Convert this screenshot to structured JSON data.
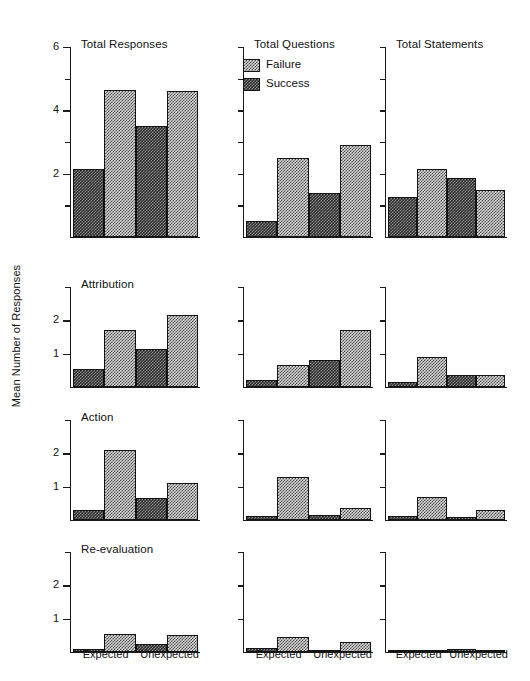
{
  "chart_data": {
    "type": "bar",
    "ylabel": "Mean Number of Responses",
    "xlabel": "",
    "grid": false,
    "legend": {
      "position": "top-center-panel",
      "entries": [
        {
          "name": "Failure",
          "swatch": "light-checker"
        },
        {
          "name": "Success",
          "swatch": "dark-checker"
        }
      ]
    },
    "categories": [
      "Expected",
      "Unexpected"
    ],
    "series_order": [
      "Success",
      "Failure"
    ],
    "bar_order": [
      "Expected-Success",
      "Expected-Failure",
      "Unexpected-Success",
      "Unexpected-Failure"
    ],
    "columns": [
      "Total Responses",
      "Total Questions",
      "Total Statements"
    ],
    "rows": [
      "Total Responses",
      "Attribution",
      "Action",
      "Re-evaluation"
    ],
    "panels": [
      {
        "row": 0,
        "col": 0,
        "title": "Total Responses",
        "ylim": [
          0,
          6
        ],
        "yticks": [
          0,
          1,
          2,
          3,
          4,
          5,
          6
        ],
        "yticklabels": [
          "",
          "",
          "2",
          "",
          "4",
          "",
          "6"
        ],
        "values": [
          2.15,
          4.65,
          3.5,
          4.6
        ]
      },
      {
        "row": 0,
        "col": 1,
        "title": "Total Questions",
        "ylim": [
          0,
          6
        ],
        "yticks": [
          0,
          1,
          2,
          3,
          4,
          5,
          6
        ],
        "yticklabels": [
          "",
          "",
          "",
          "",
          "",
          "",
          ""
        ],
        "values": [
          0.5,
          2.5,
          1.4,
          2.9
        ]
      },
      {
        "row": 0,
        "col": 2,
        "title": "Total Statements",
        "ylim": [
          0,
          6
        ],
        "yticks": [
          0,
          1,
          2,
          3,
          4,
          5,
          6
        ],
        "yticklabels": [
          "",
          "",
          "",
          "",
          "",
          "",
          ""
        ],
        "values": [
          1.25,
          2.15,
          1.85,
          1.5
        ]
      },
      {
        "row": 1,
        "col": 0,
        "title": "Attribution",
        "ylim": [
          0,
          3
        ],
        "yticks": [
          0,
          1,
          2,
          3
        ],
        "yticklabels": [
          "",
          "1",
          "2",
          ""
        ],
        "values": [
          0.55,
          1.7,
          1.15,
          2.15
        ]
      },
      {
        "row": 1,
        "col": 1,
        "title": "",
        "ylim": [
          0,
          3
        ],
        "yticks": [
          0,
          1,
          2,
          3
        ],
        "yticklabels": [
          "",
          "",
          "",
          ""
        ],
        "values": [
          0.2,
          0.65,
          0.8,
          1.7
        ]
      },
      {
        "row": 1,
        "col": 2,
        "title": "",
        "ylim": [
          0,
          3
        ],
        "yticks": [
          0,
          1,
          2,
          3
        ],
        "yticklabels": [
          "",
          "",
          "",
          ""
        ],
        "values": [
          0.15,
          0.9,
          0.35,
          0.35
        ]
      },
      {
        "row": 2,
        "col": 0,
        "title": "Action",
        "ylim": [
          0,
          3
        ],
        "yticks": [
          0,
          1,
          2,
          3
        ],
        "yticklabels": [
          "",
          "1",
          "2",
          ""
        ],
        "values": [
          0.3,
          2.1,
          0.65,
          1.1
        ]
      },
      {
        "row": 2,
        "col": 1,
        "title": "",
        "ylim": [
          0,
          3
        ],
        "yticks": [
          0,
          1,
          2,
          3
        ],
        "yticklabels": [
          "",
          "",
          "",
          ""
        ],
        "values": [
          0.12,
          1.3,
          0.15,
          0.35
        ]
      },
      {
        "row": 2,
        "col": 2,
        "title": "",
        "ylim": [
          0,
          3
        ],
        "yticks": [
          0,
          1,
          2,
          3
        ],
        "yticklabels": [
          "",
          "",
          "",
          ""
        ],
        "values": [
          0.12,
          0.7,
          0.1,
          0.3
        ]
      },
      {
        "row": 3,
        "col": 0,
        "title": "Re-evaluation",
        "ylim": [
          0,
          3
        ],
        "yticks": [
          0,
          1,
          2,
          3
        ],
        "yticklabels": [
          "",
          "1",
          "2",
          ""
        ],
        "values": [
          0.1,
          0.55,
          0.25,
          0.5
        ]
      },
      {
        "row": 3,
        "col": 1,
        "title": "",
        "ylim": [
          0,
          3
        ],
        "yticks": [
          0,
          1,
          2,
          3
        ],
        "yticklabels": [
          "",
          "",
          "",
          ""
        ],
        "values": [
          0.12,
          0.45,
          0.06,
          0.3
        ]
      },
      {
        "row": 3,
        "col": 2,
        "title": "",
        "ylim": [
          0,
          3
        ],
        "yticks": [
          0,
          1,
          2,
          3
        ],
        "yticklabels": [
          "",
          "",
          "",
          ""
        ],
        "values": [
          0.0,
          0.07,
          0.1,
          0.06
        ]
      }
    ],
    "xtick_labels_per_column": [
      [
        "Expected",
        "Unexpected"
      ],
      [
        "Expected",
        "Unexpected"
      ],
      [
        "Expected",
        "Unexpected"
      ]
    ],
    "colors": {
      "failure_fill": "#d9d9d9",
      "failure_pattern": "#4a4a4a",
      "success_fill": "#2b2b2b",
      "success_pattern": "#8e8e8e",
      "axis": "#1a1a1a",
      "text": "#111111",
      "background": "#ffffff"
    }
  },
  "axis_label": {
    "y": "Mean Number of Responses"
  },
  "legend_labels": {
    "failure": "Failure",
    "success": "Success"
  },
  "panel_titles": {
    "total_responses": "Total Responses",
    "total_questions": "Total Questions",
    "total_statements": "Total Statements",
    "attribution": "Attribution",
    "action": "Action",
    "reevaluation": "Re-evaluation"
  },
  "xtick": {
    "expected": "Expected",
    "unexpected": "Unexpected"
  }
}
